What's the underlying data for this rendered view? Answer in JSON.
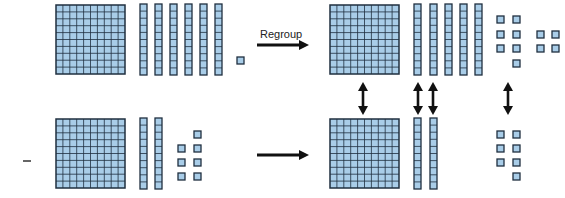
{
  "colors": {
    "block_fill": "#a9cde8",
    "block_stroke": "#1f2f3f",
    "arrow": "#111111"
  },
  "labels": {
    "regroup": "Regroup",
    "minus": "−"
  },
  "minuend_original": {
    "value": 161,
    "hundreds": 1,
    "tens": 6,
    "ones": 1
  },
  "minuend_regrouped": {
    "value": 161,
    "hundreds": 1,
    "tens": 5,
    "ones": 11
  },
  "subtrahend": {
    "value": 127,
    "hundreds": 1,
    "tens": 2,
    "ones": 7
  },
  "result_subtrahend_matched": {
    "hundreds": 1,
    "tens": 2,
    "ones": 7
  },
  "arrows": [
    {
      "type": "right",
      "label": "Regroup",
      "row": "top"
    },
    {
      "type": "right",
      "label": "",
      "row": "bottom"
    },
    {
      "type": "double-vertical",
      "column": "hundreds"
    },
    {
      "type": "double-vertical",
      "column": "tens-1"
    },
    {
      "type": "double-vertical",
      "column": "tens-2"
    },
    {
      "type": "double-vertical",
      "column": "ones"
    }
  ]
}
